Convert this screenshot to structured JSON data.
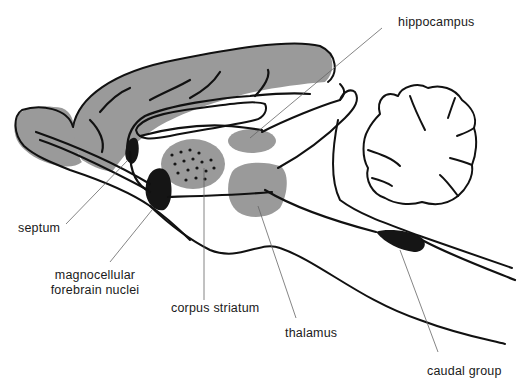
{
  "diagram": {
    "type": "anatomical-sagittal-brain-section",
    "colors": {
      "background": "#ffffff",
      "gray_region": "#9a9a9a",
      "nucleus_black": "#151515",
      "outline": "#111111",
      "leader_line": "#666666",
      "label_text": "#1a1a1a"
    },
    "labels": {
      "hippocampus": "hippocampus",
      "septum": "septum",
      "magnocellular_line1": "magnocellular",
      "magnocellular_line2": "forebrain nuclei",
      "corpus_striatum": "corpus striatum",
      "thalamus": "thalamus",
      "caudal_group": "caudal group"
    },
    "structures": [
      {
        "name": "cortex",
        "fill": "gray"
      },
      {
        "name": "olfactory-bulb",
        "fill": "gray"
      },
      {
        "name": "hippocampus",
        "fill": "gray"
      },
      {
        "name": "corpus-striatum",
        "fill": "gray",
        "pattern": "dotted"
      },
      {
        "name": "thalamus",
        "fill": "gray"
      },
      {
        "name": "septum",
        "fill": "black"
      },
      {
        "name": "magnocellular-forebrain-nuclei",
        "fill": "black"
      },
      {
        "name": "caudal-group",
        "fill": "black"
      },
      {
        "name": "cerebellum",
        "fill": "none"
      },
      {
        "name": "corpus-callosum",
        "fill": "none"
      }
    ]
  }
}
